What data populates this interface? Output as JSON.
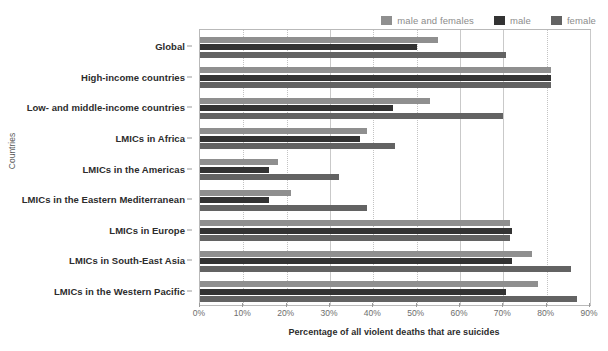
{
  "legend": {
    "position": "top-right",
    "entries": [
      {
        "label": "male and females",
        "color": "#8f8f8f",
        "name": "legend-male-and-females"
      },
      {
        "label": "male",
        "color": "#333333",
        "name": "legend-male"
      },
      {
        "label": "female",
        "color": "#636363",
        "name": "legend-female"
      }
    ]
  },
  "axes": {
    "y_title": "Countries",
    "x_title": "Percentage of all violent deaths that are suicides",
    "x_ticks": [
      "0%",
      "10%",
      "20%",
      "30%",
      "40%",
      "50%",
      "60%",
      "70%",
      "80%",
      "90%"
    ]
  },
  "chart_data": {
    "type": "bar",
    "orientation": "horizontal",
    "title": "",
    "xlabel": "Percentage of all violent deaths that are suicides",
    "ylabel": "Countries",
    "xlim": [
      0,
      90
    ],
    "xticks": [
      0,
      10,
      20,
      30,
      40,
      50,
      60,
      70,
      80,
      90
    ],
    "xtick_labels": [
      "0%",
      "10%",
      "20%",
      "30%",
      "40%",
      "50%",
      "60%",
      "70%",
      "80%",
      "90%"
    ],
    "grid": "vertical-dotted",
    "legend_position": "top-right",
    "categories": [
      "Global",
      "High-income countries",
      "Low- and middle-income countries",
      "LMICs in Africa",
      "LMICs in the Americas",
      "LMICs in the Eastern Mediterranean",
      "LMICs in Europe",
      "LMICs in South-East Asia",
      "LMICs in the Western Pacific"
    ],
    "series": [
      {
        "name": "male and females",
        "color": "#8f8f8f",
        "values": [
          55.0,
          81.0,
          53.0,
          38.5,
          18.0,
          21.0,
          71.5,
          76.5,
          78.0
        ]
      },
      {
        "name": "male",
        "color": "#333333",
        "values": [
          50.0,
          81.0,
          44.5,
          37.0,
          16.0,
          16.0,
          72.0,
          72.0,
          70.5
        ]
      },
      {
        "name": "female",
        "color": "#636363",
        "values": [
          70.5,
          81.0,
          70.0,
          45.0,
          32.0,
          38.5,
          71.5,
          85.5,
          87.0
        ]
      }
    ]
  }
}
